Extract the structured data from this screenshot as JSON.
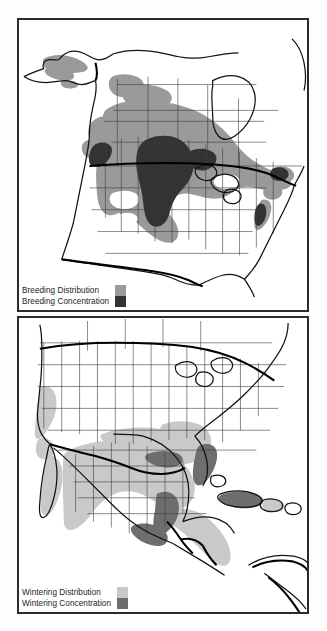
{
  "figure": {
    "background_color": "#fdfdfd",
    "panel_border_color": "#2b2b2b"
  },
  "colors": {
    "breeding_distribution": "#9a9a9a",
    "breeding_concentration": "#333333",
    "wintering_distribution": "#c9c9c9",
    "wintering_concentration": "#6e6e6e",
    "coastline": "#1a1a1a",
    "state_border": "#4a4a4a",
    "country_border": "#000000",
    "land_fill": "#ffffff",
    "water_fill": "#ffffff"
  },
  "panels": [
    {
      "id": "breeding",
      "name": "Breeding range map",
      "season": "Breeding",
      "legend": {
        "rows": [
          {
            "label": "Breeding Distribution",
            "swatch_color": "#9a9a9a",
            "swatch_name": "breeding-distribution-swatch"
          },
          {
            "label": "Breeding Concentration",
            "swatch_color": "#333333",
            "swatch_name": "breeding-concentration-swatch"
          }
        ]
      }
    },
    {
      "id": "wintering",
      "name": "Wintering range map",
      "season": "Wintering",
      "legend": {
        "rows": [
          {
            "label": "Wintering Distribution",
            "swatch_color": "#c9c9c9",
            "swatch_name": "wintering-distribution-swatch"
          },
          {
            "label": "Wintering Concentration",
            "swatch_color": "#6e6e6e",
            "swatch_name": "wintering-concentration-swatch"
          }
        ]
      }
    }
  ]
}
